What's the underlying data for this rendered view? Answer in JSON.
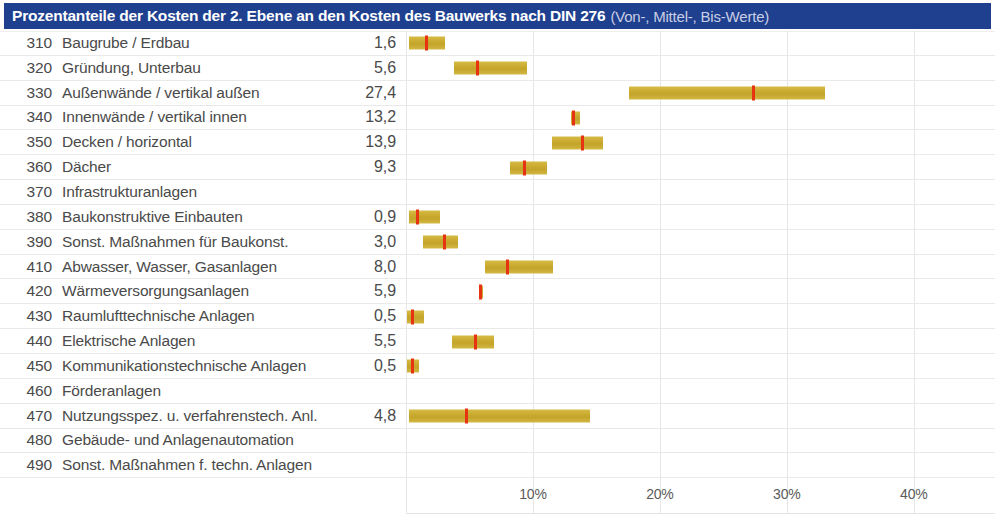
{
  "header": {
    "title_main": "Prozentanteile der Kosten der 2. Ebene an den Kosten des Bauwerks nach DIN 276",
    "title_sub": "(Von-, Mittel-, Bis-Werte)",
    "background_color": "#1f3f8f",
    "text_color": "#ffffff"
  },
  "colors": {
    "bar": "#c8a82c",
    "marker": "#e63312",
    "grid": "#e6e6e7",
    "text": "#4a4a4a"
  },
  "chart_data": {
    "type": "bar",
    "title": "Prozentanteile der Kosten der 2. Ebene an den Kosten des Bauwerks nach DIN 276 (Von-, Mittel-, Bis-Werte)",
    "xlabel": "",
    "ylabel": "",
    "xlim": [
      0,
      46.4
    ],
    "grid": true,
    "legend": "none",
    "value_label_format": "german-decimal-comma",
    "axis_ticks": [
      {
        "label": "10%",
        "value": 10
      },
      {
        "label": "20%",
        "value": 20
      },
      {
        "label": "30%",
        "value": 30
      },
      {
        "label": "40%",
        "value": 40
      }
    ],
    "columns": [
      "Code",
      "Kostengruppe",
      "Mittelwert %",
      "Von %",
      "Bis %"
    ],
    "rows": [
      {
        "code": "310",
        "label": "Baugrube / Erdbau",
        "value": "1,6",
        "mid": 1.6,
        "von": 0.2,
        "bis": 3.1
      },
      {
        "code": "320",
        "label": "Gründung, Unterbau",
        "value": "5,6",
        "mid": 5.6,
        "von": 3.8,
        "bis": 9.5
      },
      {
        "code": "330",
        "label": "Außenwände / vertikal außen",
        "value": "27,4",
        "mid": 27.4,
        "von": 17.6,
        "bis": 33.0
      },
      {
        "code": "340",
        "label": "Innenwände / vertikal innen",
        "value": "13,2",
        "mid": 13.2,
        "von": 13.0,
        "bis": 13.7
      },
      {
        "code": "350",
        "label": "Decken / horizontal",
        "value": "13,9",
        "mid": 13.9,
        "von": 11.5,
        "bis": 15.5
      },
      {
        "code": "360",
        "label": "Dächer",
        "value": "9,3",
        "mid": 9.3,
        "von": 8.2,
        "bis": 11.1
      },
      {
        "code": "370",
        "label": "Infrastrukturanlagen",
        "value": "",
        "mid": null,
        "von": null,
        "bis": null
      },
      {
        "code": "380",
        "label": "Baukonstruktive Einbauten",
        "value": "0,9",
        "mid": 0.9,
        "von": 0.2,
        "bis": 2.7
      },
      {
        "code": "390",
        "label": "Sonst. Maßnahmen für Baukonst.",
        "value": "3,0",
        "mid": 3.0,
        "von": 1.3,
        "bis": 4.1
      },
      {
        "code": "410",
        "label": "Abwasser, Wasser, Gasanlagen",
        "value": "8,0",
        "mid": 8.0,
        "von": 6.2,
        "bis": 11.6
      },
      {
        "code": "420",
        "label": "Wärmeversorgungsanlagen",
        "value": "5,9",
        "mid": 5.9,
        "von": 5.8,
        "bis": 6.0
      },
      {
        "code": "430",
        "label": "Raumlufttechnische Anlagen",
        "value": "0,5",
        "mid": 0.5,
        "von": 0.1,
        "bis": 1.4
      },
      {
        "code": "440",
        "label": "Elektrische Anlagen",
        "value": "5,5",
        "mid": 5.5,
        "von": 3.6,
        "bis": 6.9
      },
      {
        "code": "450",
        "label": "Kommunikationstechnische Anlagen",
        "value": "0,5",
        "mid": 0.5,
        "von": 0.1,
        "bis": 1.0
      },
      {
        "code": "460",
        "label": "Förderanlagen",
        "value": "",
        "mid": null,
        "von": null,
        "bis": null
      },
      {
        "code": "470",
        "label": "Nutzungsspez. u. verfahrenstech. Anl.",
        "value": "4,8",
        "mid": 4.8,
        "von": 0.2,
        "bis": 14.5
      },
      {
        "code": "480",
        "label": "Gebäude- und Anlagenautomation",
        "value": "",
        "mid": null,
        "von": null,
        "bis": null
      },
      {
        "code": "490",
        "label": "Sonst. Maßnahmen f. techn. Anlagen",
        "value": "",
        "mid": null,
        "von": null,
        "bis": null
      }
    ]
  }
}
